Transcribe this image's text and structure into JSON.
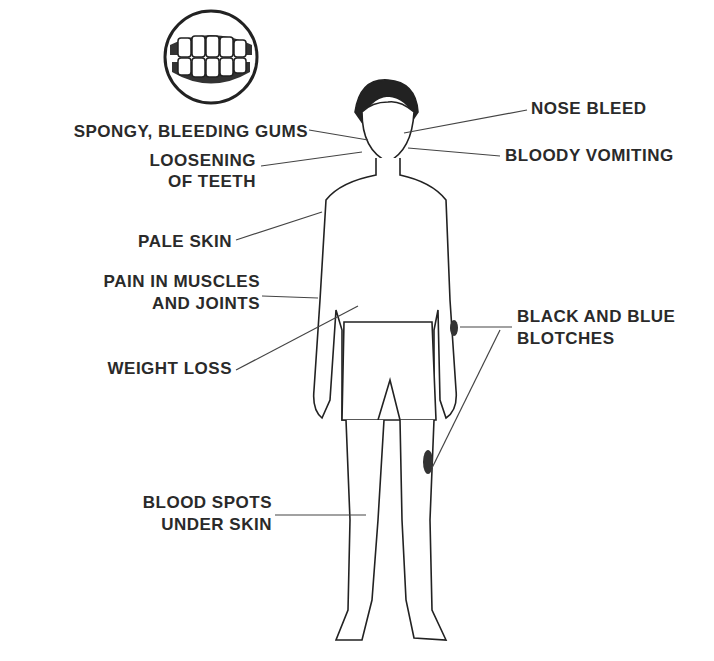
{
  "labels": {
    "spongy_gums": "SPONGY, BLEEDING GUMS",
    "loosening_1": "LOOSENING",
    "loosening_2": "OF TEETH",
    "pale_skin": "PALE SKIN",
    "pain_1": "PAIN IN MUSCLES",
    "pain_2": "AND JOINTS",
    "weight_loss": "WEIGHT LOSS",
    "blood_spots_1": "BLOOD SPOTS",
    "blood_spots_2": "UNDER SKIN",
    "nose_bleed": "NOSE BLEED",
    "bloody_vomiting": "BLOODY VOMITING",
    "blotches_1": "BLACK AND BLUE",
    "blotches_2": "BLOTCHES"
  },
  "colors": {
    "ink": "#2a2a2a",
    "background": "#ffffff"
  }
}
